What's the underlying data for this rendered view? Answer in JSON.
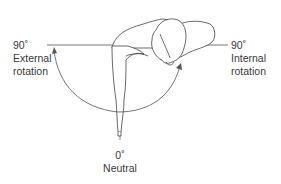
{
  "figure": {
    "labels": {
      "left": {
        "angle": "90˚",
        "line1": "External",
        "line2": "rotation"
      },
      "right": {
        "angle": "90˚",
        "line1": "Internal",
        "line2": "rotation"
      },
      "bottom": {
        "angle": "0˚",
        "line1": "Neutral"
      }
    },
    "colors": {
      "line": "#555555",
      "text": "#3a3a3a",
      "background": "#ffffff"
    }
  }
}
